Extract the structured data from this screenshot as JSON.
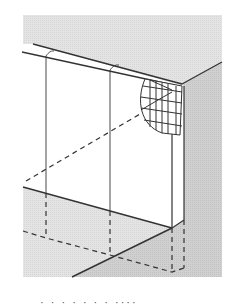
{
  "figure": {
    "colors": {
      "background": "#ffffff",
      "top_plane": "#e6e6e6",
      "right_face": "#d2d2d2",
      "ground_left": "#e0e0e0",
      "ground_right": "#cfcfcf",
      "wall_face": "#ffffff",
      "line": "#333333",
      "mesh": "#444444"
    },
    "elements": [
      "top-surface-plane",
      "wall-front-face",
      "wall-right-face",
      "wall-cap-edges",
      "vertical-joint-lines",
      "reinforcement-mesh-cutaway",
      "hidden-footing-dashed-lines",
      "ground-plane",
      "floor-diagonal-line"
    ]
  },
  "caption": {
    "text": "· · · · · ·  · ····"
  }
}
